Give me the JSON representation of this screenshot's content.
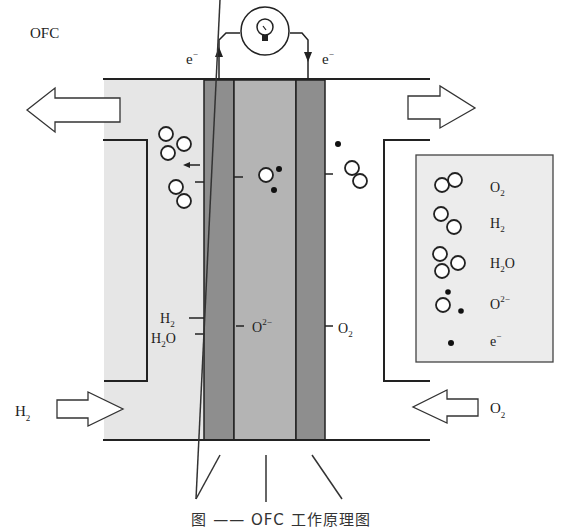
{
  "title": "OFC",
  "caption": "图 —— OFC 工作原理图",
  "circuit": {
    "left_electron_label": "e",
    "left_electron_sup": "−",
    "right_electron_label": "e",
    "right_electron_sup": "−",
    "load_icon": "lightbulb-icon"
  },
  "inlets_outlets": {
    "anode_inlet_label": "H",
    "anode_inlet_sub": "2",
    "cathode_inlet_label": "O",
    "cathode_inlet_sub": "2"
  },
  "reaction_labels": {
    "anode_h2": "H",
    "anode_h2_sub": "2",
    "anode_h2o": "H",
    "anode_h2o_sub": "2",
    "anode_h2o_tail": "O",
    "electrolyte_ion": "O",
    "electrolyte_ion_sup": "2−",
    "cathode_o2": "O",
    "cathode_o2_sub": "2"
  },
  "layers": [
    {
      "name": "anode",
      "color": "#8e8e8e"
    },
    {
      "name": "electrolyte",
      "color": "#b4b4b4"
    },
    {
      "name": "cathode",
      "color": "#8e8e8e"
    }
  ],
  "colors": {
    "anode_chamber": "#e6e6e6",
    "legend_bg": "#ececec",
    "line": "#222222"
  },
  "legend": {
    "items": [
      {
        "symbol": "o2-molecule",
        "label": "O",
        "sub": "2",
        "sup": ""
      },
      {
        "symbol": "h2-molecule",
        "label": "H",
        "sub": "2",
        "sup": ""
      },
      {
        "symbol": "h2o-molecule",
        "label": "H",
        "sub": "2",
        "sup": "",
        "tail": "O"
      },
      {
        "symbol": "oxide-ion",
        "label": "O",
        "sub": "",
        "sup": "2−"
      },
      {
        "symbol": "electron",
        "label": "e",
        "sub": "",
        "sup": "−"
      }
    ]
  }
}
